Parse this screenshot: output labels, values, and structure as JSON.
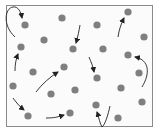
{
  "diagram": {
    "colors": {
      "background": "#fbfbfb",
      "border": "#8a8a8a",
      "particle": "#7f7f7f",
      "arrow": "#222222"
    },
    "particle_count": 23,
    "arrow_count": 10
  }
}
